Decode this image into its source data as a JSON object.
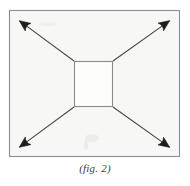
{
  "figure": {
    "caption": "(fig. 2)",
    "background_color": "#ffffff",
    "panel_fill": "#f7f7f5",
    "frame_stroke": "#8d8d8d",
    "inner_rect_fill": "#fdfdfc",
    "inner_rect_stroke": "#8a8a8a",
    "arrow_stroke": "#4a4a4a",
    "arrowhead_fill": "#1d1d1d",
    "frame": {
      "label": "outer-frame",
      "x": 9,
      "y": 10,
      "width": 171,
      "height": 147
    },
    "inner_rect": {
      "label": "center-rectangle",
      "x": 74,
      "y": 61,
      "width": 39,
      "height": 46
    },
    "arrows": [
      {
        "name": "arrow-up-left",
        "direction": "up-left",
        "from_x": 74,
        "from_y": 61,
        "to_x": 17,
        "to_y": 19
      },
      {
        "name": "arrow-up-right",
        "direction": "up-right",
        "from_x": 113,
        "from_y": 61,
        "to_x": 172,
        "to_y": 19
      },
      {
        "name": "arrow-down-left",
        "direction": "down-left",
        "from_x": 74,
        "from_y": 107,
        "to_x": 17,
        "to_y": 149
      },
      {
        "name": "arrow-down-right",
        "direction": "down-right",
        "from_x": 113,
        "from_y": 107,
        "to_x": 172,
        "to_y": 149
      }
    ]
  }
}
